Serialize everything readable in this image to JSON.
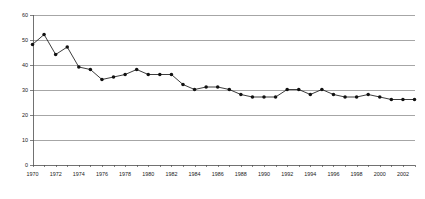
{
  "chart_data": {
    "type": "line",
    "title": "",
    "subtitle": "",
    "xlabel": "",
    "ylabel": "",
    "xlim": [
      1970,
      2003
    ],
    "ylim": [
      0,
      60
    ],
    "grid": true,
    "grid_axis": "y",
    "legend": false,
    "legend_position": "none",
    "marker": "filled-circle",
    "y_ticks": [
      0,
      10,
      20,
      30,
      40,
      50,
      60
    ],
    "y_tick_labels": [
      "0",
      "10",
      "20",
      "30",
      "40",
      "50",
      "60"
    ],
    "x_ticks": [
      1970,
      1971,
      1972,
      1973,
      1974,
      1975,
      1976,
      1977,
      1978,
      1979,
      1980,
      1981,
      1982,
      1983,
      1984,
      1985,
      1986,
      1987,
      1988,
      1989,
      1990,
      1991,
      1992,
      1993,
      1994,
      1995,
      1996,
      1997,
      1998,
      1999,
      2000,
      2001,
      2002,
      2003
    ],
    "x_tick_labels": [
      "1970",
      "",
      "1972",
      "",
      "1974",
      "",
      "1976",
      "",
      "1978",
      "",
      "1980",
      "",
      "1982",
      "",
      "1984",
      "",
      "1986",
      "",
      "1988",
      "",
      "1990",
      "",
      "1992",
      "",
      "1994",
      "",
      "1996",
      "",
      "1998",
      "",
      "2000",
      "",
      "2002",
      ""
    ],
    "x": [
      1970,
      1971,
      1972,
      1973,
      1974,
      1975,
      1976,
      1977,
      1978,
      1979,
      1980,
      1981,
      1982,
      1983,
      1984,
      1985,
      1986,
      1987,
      1988,
      1989,
      1990,
      1991,
      1992,
      1993,
      1994,
      1995,
      1996,
      1997,
      1998,
      1999,
      2000,
      2001,
      2002,
      2003
    ],
    "values": [
      48,
      52,
      44,
      47,
      39,
      38,
      34,
      35,
      36,
      38,
      36,
      36,
      36,
      32,
      30,
      31,
      31,
      30,
      28,
      27,
      27,
      27,
      30,
      30,
      28,
      30,
      28,
      27,
      27,
      28,
      27,
      26,
      26,
      26
    ],
    "series": [
      {
        "name": "series-1",
        "color": "#1a1a1a",
        "values": [
          48,
          52,
          44,
          47,
          39,
          38,
          34,
          35,
          36,
          38,
          36,
          36,
          36,
          32,
          30,
          31,
          31,
          30,
          28,
          27,
          27,
          27,
          30,
          30,
          28,
          30,
          28,
          27,
          27,
          28,
          27,
          26,
          26,
          26
        ]
      }
    ],
    "colors": {
      "line": "#1a1a1a",
      "marker": "#111111",
      "grid": "#808080",
      "axis": "#4d4d4d",
      "text": "#1a1a1a",
      "background": "#ffffff"
    }
  }
}
